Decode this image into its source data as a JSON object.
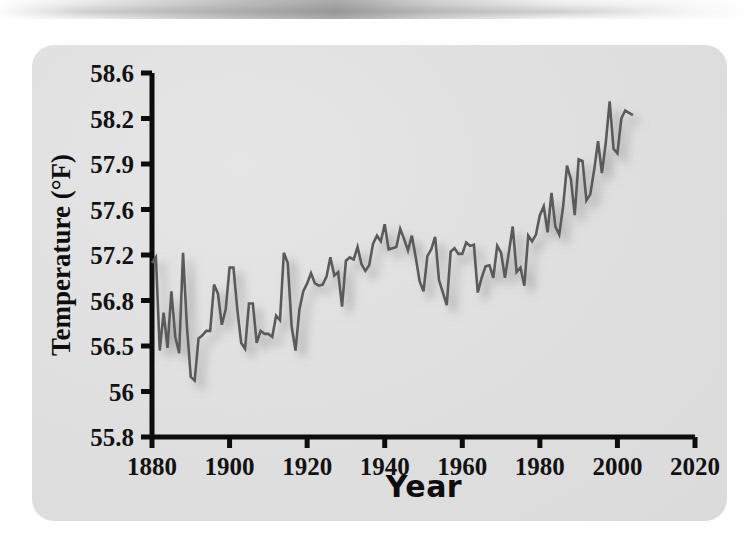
{
  "figure": {
    "panel_bg_color": "#e2e2e2",
    "line_color": "#5a5a5a",
    "shadow_color": "#9a9a9a",
    "axis_color": "#0d0d0d",
    "text_color": "#121212"
  },
  "chart_data": {
    "type": "line",
    "title": "",
    "xlabel": "Year",
    "ylabel": "Temperature (°F)",
    "xlim": [
      1880,
      2020
    ],
    "ylim": [
      55.8,
      58.6
    ],
    "grid": false,
    "legend": "none",
    "xticks": [
      "1880",
      "1900",
      "1920",
      "1940",
      "1960",
      "1980",
      "2000",
      "2020"
    ],
    "xtick_values": [
      1880,
      1900,
      1920,
      1940,
      1960,
      1980,
      2000,
      2020
    ],
    "yticks": [
      "55.8",
      "56",
      "56.5",
      "56.8",
      "57.2",
      "57.6",
      "57.9",
      "58.2",
      "58.6"
    ],
    "ytick_values": [
      55.8,
      56,
      56.5,
      56.8,
      57.2,
      57.6,
      57.9,
      58.2,
      58.6
    ],
    "ytick_spacing_note": "tick labels are evenly spaced in pixels although their numeric steps are uneven",
    "series": [
      {
        "name": "Global mean surface temperature",
        "x": [
          1880,
          1881,
          1882,
          1883,
          1884,
          1885,
          1886,
          1887,
          1888,
          1889,
          1890,
          1891,
          1892,
          1893,
          1894,
          1895,
          1896,
          1897,
          1898,
          1899,
          1900,
          1901,
          1902,
          1903,
          1904,
          1905,
          1906,
          1907,
          1908,
          1909,
          1910,
          1911,
          1912,
          1913,
          1914,
          1915,
          1916,
          1917,
          1918,
          1919,
          1920,
          1921,
          1922,
          1923,
          1924,
          1925,
          1926,
          1927,
          1928,
          1929,
          1930,
          1931,
          1932,
          1933,
          1934,
          1935,
          1936,
          1937,
          1938,
          1939,
          1940,
          1941,
          1942,
          1943,
          1944,
          1945,
          1946,
          1947,
          1948,
          1949,
          1950,
          1951,
          1952,
          1953,
          1954,
          1955,
          1956,
          1957,
          1958,
          1959,
          1960,
          1961,
          1962,
          1963,
          1964,
          1965,
          1966,
          1967,
          1968,
          1969,
          1970,
          1971,
          1972,
          1973,
          1974,
          1975,
          1976,
          1977,
          1978,
          1979,
          1980,
          1981,
          1982,
          1983,
          1984,
          1985,
          1986,
          1987,
          1988,
          1989,
          1990,
          1991,
          1992,
          1993,
          1994,
          1995,
          1996,
          1997,
          1998,
          1999,
          2000,
          2001,
          2002,
          2003,
          2004
        ],
        "y": [
          57.13,
          57.18,
          56.45,
          56.72,
          56.48,
          56.88,
          56.56,
          56.42,
          57.22,
          56.63,
          56.16,
          56.12,
          56.55,
          56.57,
          56.6,
          56.6,
          56.94,
          56.86,
          56.64,
          56.74,
          57.09,
          57.09,
          56.74,
          56.52,
          56.47,
          56.78,
          56.78,
          56.52,
          56.6,
          56.58,
          56.58,
          56.56,
          56.7,
          56.67,
          57.22,
          57.13,
          56.63,
          56.45,
          56.74,
          56.88,
          56.95,
          57.04,
          56.95,
          56.93,
          56.94,
          57.01,
          57.18,
          57.02,
          57.05,
          56.76,
          57.15,
          57.18,
          57.16,
          57.27,
          57.12,
          57.06,
          57.11,
          57.3,
          57.37,
          57.32,
          57.47,
          57.25,
          57.26,
          57.27,
          57.43,
          57.34,
          57.24,
          57.37,
          57.18,
          56.97,
          56.88,
          57.19,
          57.25,
          57.36,
          56.98,
          56.87,
          56.77,
          57.23,
          57.26,
          57.21,
          57.21,
          57.31,
          57.28,
          57.29,
          56.87,
          57.0,
          57.1,
          57.11,
          57.0,
          57.28,
          57.22,
          57.0,
          57.22,
          57.45,
          57.05,
          57.09,
          56.93,
          57.37,
          57.32,
          57.38,
          57.55,
          57.62,
          57.4,
          57.71,
          57.45,
          57.38,
          57.62,
          57.89,
          57.8,
          57.55,
          57.93,
          57.92,
          57.66,
          57.7,
          57.86,
          58.05,
          57.84,
          58.04,
          58.35,
          58.0,
          57.97,
          58.2,
          58.27,
          58.25,
          58.23
        ],
        "color": "#5a5a5a"
      }
    ]
  }
}
